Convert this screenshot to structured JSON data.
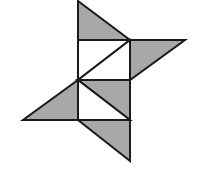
{
  "diagram": {
    "type": "geometric-figure",
    "colors": {
      "background": "#ffffff",
      "stroke": "#1a1a1a",
      "shade": "#a8a8a8",
      "blank": "#ffffff"
    },
    "stroke_width": 2,
    "shapes": [
      {
        "name": "top-triangle",
        "fill": "shade",
        "points": [
          [
            78,
            1
          ],
          [
            78,
            40
          ],
          [
            130,
            40
          ]
        ]
      },
      {
        "name": "upper-square-left-half",
        "fill": "blank",
        "points": [
          [
            78,
            40
          ],
          [
            130,
            40
          ],
          [
            78,
            80
          ]
        ]
      },
      {
        "name": "upper-square-right-half",
        "fill": "blank",
        "points": [
          [
            130,
            40
          ],
          [
            130,
            80
          ],
          [
            78,
            80
          ]
        ]
      },
      {
        "name": "right-triangle",
        "fill": "shade",
        "points": [
          [
            130,
            40
          ],
          [
            185,
            40
          ],
          [
            130,
            80
          ]
        ]
      },
      {
        "name": "lower-square-upper-half",
        "fill": "shade",
        "points": [
          [
            78,
            80
          ],
          [
            130,
            80
          ],
          [
            130,
            120
          ]
        ]
      },
      {
        "name": "lower-square-lower-half",
        "fill": "blank",
        "points": [
          [
            78,
            80
          ],
          [
            130,
            120
          ],
          [
            78,
            120
          ]
        ]
      },
      {
        "name": "left-triangle",
        "fill": "shade",
        "points": [
          [
            78,
            80
          ],
          [
            78,
            120
          ],
          [
            23,
            120
          ]
        ]
      },
      {
        "name": "bottom-triangle",
        "fill": "shade",
        "points": [
          [
            78,
            120
          ],
          [
            130,
            120
          ],
          [
            130,
            161
          ]
        ]
      }
    ]
  }
}
